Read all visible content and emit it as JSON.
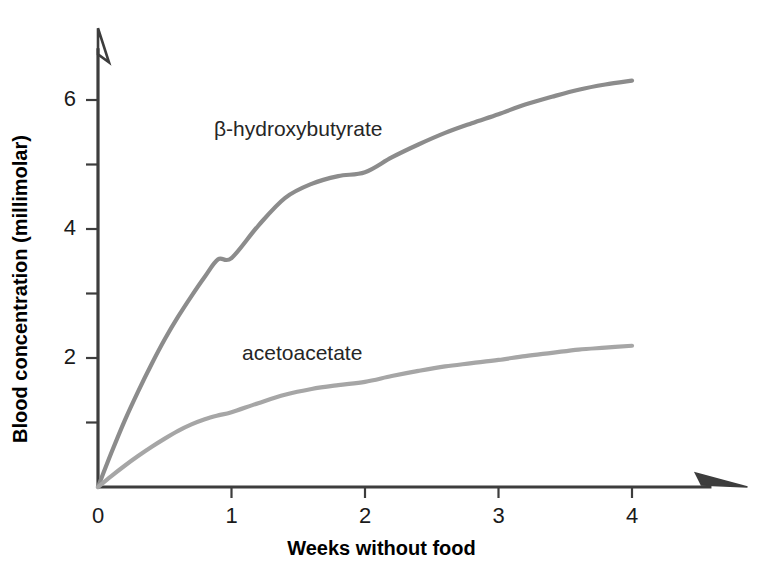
{
  "chart_data": {
    "type": "line",
    "title": "",
    "xlabel": "Weeks without food",
    "ylabel": "Blood concentration (millimolar)",
    "xlim": [
      0,
      4.7
    ],
    "ylim": [
      0,
      7.05
    ],
    "xticks": [
      0,
      1,
      2,
      3,
      4
    ],
    "xticklabels": [
      "0",
      "1",
      "2",
      "3",
      "4"
    ],
    "yticks": [
      0,
      1,
      2,
      3,
      4,
      5,
      6
    ],
    "yticklabels": [
      "",
      "",
      "2",
      "",
      "4",
      "",
      "6"
    ],
    "grid": false,
    "legend": "inline-annotations",
    "axis_style": "open-arrow-axes",
    "series": [
      {
        "name": "β-hydroxybutyrate",
        "color": "#8c8c8c",
        "label_x": 1.5,
        "label_y": 5.57,
        "x": [
          0,
          0.1,
          0.2,
          0.3,
          0.4,
          0.5,
          0.6,
          0.7,
          0.8,
          0.9,
          1.0,
          1.2,
          1.4,
          1.6,
          1.8,
          2.0,
          2.2,
          2.4,
          2.6,
          2.8,
          3.0,
          3.2,
          3.4,
          3.6,
          3.8,
          4.0
        ],
        "y": [
          0,
          0.53,
          1.03,
          1.48,
          1.9,
          2.29,
          2.64,
          2.96,
          3.26,
          3.53,
          3.55,
          4.05,
          4.48,
          4.7,
          4.82,
          4.88,
          5.11,
          5.31,
          5.49,
          5.64,
          5.78,
          5.93,
          6.05,
          6.16,
          6.24,
          6.3
        ]
      },
      {
        "name": "acetoacetate",
        "color": "#a6a6a6",
        "label_x": 1.53,
        "label_y": 2.09,
        "x": [
          0,
          0.1,
          0.2,
          0.3,
          0.4,
          0.5,
          0.6,
          0.7,
          0.8,
          0.9,
          1.0,
          1.2,
          1.4,
          1.6,
          1.8,
          2.0,
          2.2,
          2.4,
          2.6,
          2.8,
          3.0,
          3.2,
          3.4,
          3.6,
          3.8,
          4.0
        ],
        "y": [
          0,
          0.17,
          0.33,
          0.48,
          0.62,
          0.75,
          0.87,
          0.97,
          1.05,
          1.11,
          1.16,
          1.3,
          1.43,
          1.52,
          1.58,
          1.63,
          1.72,
          1.8,
          1.87,
          1.92,
          1.97,
          2.03,
          2.08,
          2.13,
          2.16,
          2.19
        ]
      }
    ]
  },
  "axes": {
    "x_title": "Weeks without food",
    "y_title": "Blood concentration (millimolar)"
  },
  "colors": {
    "axis": "#3d3d3d",
    "text": "#000000",
    "beta_hydroxybutyrate": "#8c8c8c",
    "acetoacetate": "#a6a6a6",
    "background": "#ffffff"
  }
}
